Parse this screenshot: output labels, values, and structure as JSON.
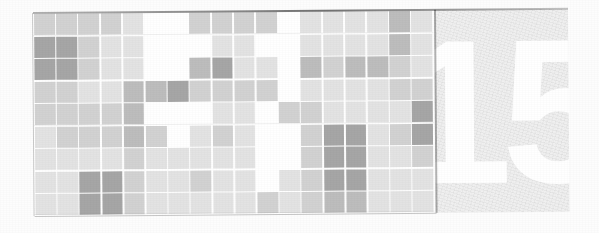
{
  "page": {
    "kind": "chapter-opener-banner",
    "background_color": "#fdfdfd"
  },
  "banner": {
    "grid_panel": {
      "background_color": "#ffffff",
      "columns": 18,
      "rows": 9
    },
    "number_panel": {
      "background_color": "#f0f0f0",
      "number": "15",
      "number_color": "#ffffff",
      "divider_color": "#2b2b2b"
    }
  },
  "chart_data": {
    "type": "heatmap",
    "title": "",
    "subtitle": "",
    "xlabel": "",
    "ylabel": "",
    "grid": false,
    "legend": null,
    "annotations": [],
    "xticklabels": [],
    "yticklabels": [],
    "ncols": 18,
    "nrows": 9,
    "value_levels": [
      0,
      1,
      2,
      3,
      4,
      5
    ],
    "level_colors": {
      "0": "#ffffff",
      "1": "#f1f1f1",
      "2": "#e3e3e3",
      "3": "#d2d2d2",
      "4": "#bdbdbd",
      "5": "#a6a6a6"
    },
    "values": [
      [
        3,
        3,
        3,
        3,
        2,
        0,
        0,
        3,
        3,
        3,
        3,
        0,
        2,
        2,
        2,
        2,
        4,
        2
      ],
      [
        5,
        5,
        3,
        2,
        2,
        0,
        0,
        0,
        2,
        2,
        0,
        0,
        2,
        2,
        2,
        2,
        4,
        2
      ],
      [
        5,
        5,
        3,
        2,
        2,
        0,
        0,
        4,
        5,
        2,
        2,
        0,
        4,
        3,
        4,
        4,
        3,
        2
      ],
      [
        3,
        3,
        2,
        2,
        4,
        4,
        5,
        3,
        3,
        3,
        3,
        0,
        2,
        2,
        2,
        2,
        3,
        3
      ],
      [
        3,
        3,
        3,
        3,
        4,
        0,
        0,
        0,
        2,
        2,
        0,
        3,
        3,
        2,
        2,
        2,
        2,
        5
      ],
      [
        2,
        3,
        3,
        3,
        4,
        3,
        0,
        2,
        3,
        2,
        0,
        0,
        3,
        5,
        5,
        2,
        3,
        5
      ],
      [
        2,
        2,
        2,
        2,
        3,
        2,
        2,
        2,
        2,
        2,
        0,
        0,
        3,
        5,
        5,
        2,
        2,
        3
      ],
      [
        2,
        2,
        5,
        5,
        3,
        2,
        2,
        3,
        2,
        2,
        0,
        2,
        3,
        5,
        5,
        2,
        2,
        2
      ],
      [
        2,
        2,
        5,
        5,
        3,
        2,
        2,
        2,
        2,
        2,
        3,
        2,
        3,
        4,
        4,
        2,
        2,
        2
      ]
    ]
  }
}
